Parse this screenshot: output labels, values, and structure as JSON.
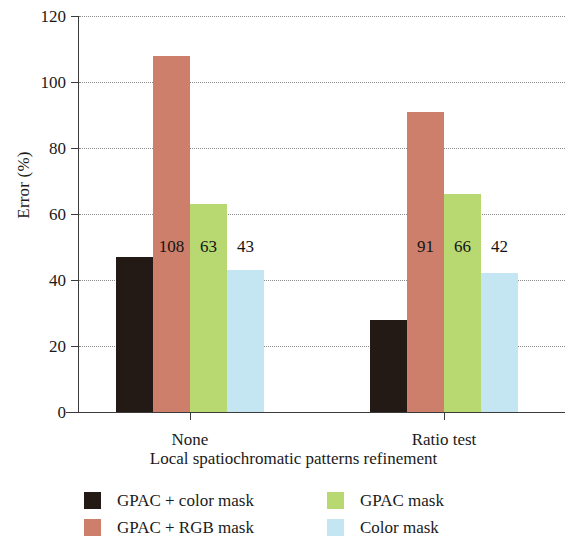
{
  "chart_data": {
    "type": "bar",
    "title": "",
    "xlabel": "Local spatiochromatic patterns refinement",
    "ylabel": "Error (%)",
    "categories": [
      "None",
      "Ratio test"
    ],
    "ylim": [
      0,
      120
    ],
    "yticks": [
      0,
      20,
      40,
      60,
      80,
      100,
      120
    ],
    "ytick_labels": [
      "0",
      "20",
      "40",
      "60",
      "80",
      "100",
      "120"
    ],
    "grid": "horizontal-dotted",
    "legend_position": "bottom",
    "series": [
      {
        "name": "GPAC + color mask",
        "color": "#231a16",
        "values": [
          47,
          28
        ],
        "labels": [
          "",
          ""
        ]
      },
      {
        "name": "GPAC + RGB mask",
        "color": "#cd7f6b",
        "values": [
          108,
          91
        ],
        "labels": [
          "108",
          "91"
        ]
      },
      {
        "name": "GPAC mask",
        "color": "#b8d971",
        "values": [
          63,
          66
        ],
        "labels": [
          "63",
          "66"
        ]
      },
      {
        "name": "Color mask",
        "color": "#c3e6f2",
        "values": [
          43,
          42
        ],
        "labels": [
          "43",
          "42"
        ]
      }
    ]
  },
  "legend": {
    "items": [
      {
        "label": "GPAC + color mask",
        "color": "#231a16"
      },
      {
        "label": "GPAC mask",
        "color": "#b8d971"
      },
      {
        "label": "GPAC + RGB mask",
        "color": "#cd7f6b"
      },
      {
        "label": "Color mask",
        "color": "#c3e6f2"
      }
    ]
  }
}
